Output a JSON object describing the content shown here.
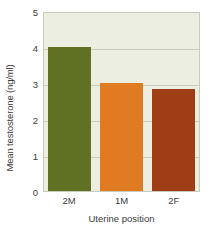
{
  "chart_data": {
    "type": "bar",
    "title": "",
    "categories": [
      "2M",
      "1M",
      "2F"
    ],
    "values": [
      4.0,
      3.0,
      2.82
    ],
    "series": [
      {
        "name": "Mean testosterone",
        "values": [
          4.0,
          3.0,
          2.82
        ]
      }
    ],
    "xlabel": "Uterine position",
    "ylabel": "Mean testosterone (ng/ml)",
    "ylim": [
      0,
      5
    ],
    "yticks": [
      0,
      1,
      2,
      3,
      4,
      5
    ],
    "ytick_labels": [
      "0",
      "1",
      "2",
      "3",
      "4",
      "5"
    ],
    "grid": true,
    "legend": false,
    "bar_colors": [
      "#607123",
      "#e07b21",
      "#9e3d16"
    ],
    "plot_background": "#eceee2",
    "gridline_color": "#c9cbbd",
    "text_color": "#3b3b3b"
  }
}
